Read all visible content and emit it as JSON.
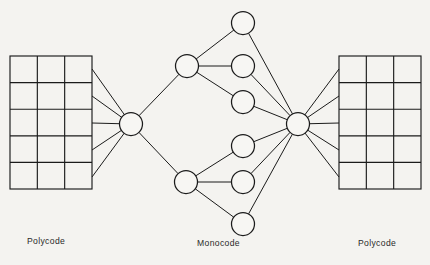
{
  "figure": {
    "background_color": "#f4f3f0",
    "stroke_color": "#1b1b1b",
    "node_fill": "#f7f6f3"
  },
  "captions": {
    "left": "Polycode",
    "middle": "Monocode",
    "right": "Polycode"
  },
  "diagram": {
    "type": "node-link-network",
    "left_grid": {
      "label": "Polycode",
      "x": 10,
      "y": 56,
      "width": 82,
      "height": 133,
      "columns": 3,
      "rows": 5
    },
    "right_grid": {
      "label": "Polycode",
      "x": 339,
      "y": 56,
      "width": 82,
      "height": 133,
      "columns": 3,
      "rows": 5
    },
    "nodes": [
      {
        "id": "hub-left",
        "name": "left-hub-node",
        "cx": 131,
        "cy": 124,
        "r": 11.5
      },
      {
        "id": "branch-up",
        "name": "upper-branch-node",
        "cx": 187,
        "cy": 66,
        "r": 11.5
      },
      {
        "id": "branch-dn",
        "name": "lower-branch-node",
        "cx": 186,
        "cy": 182,
        "r": 11.5
      },
      {
        "id": "leaf-1",
        "name": "leaf-node-1",
        "cx": 243,
        "cy": 23,
        "r": 11.5
      },
      {
        "id": "leaf-2",
        "name": "leaf-node-2",
        "cx": 243,
        "cy": 66,
        "r": 11.5
      },
      {
        "id": "leaf-3",
        "name": "leaf-node-3",
        "cx": 243,
        "cy": 102,
        "r": 11.5
      },
      {
        "id": "leaf-4",
        "name": "leaf-node-4",
        "cx": 243,
        "cy": 146,
        "r": 11.5
      },
      {
        "id": "leaf-5",
        "name": "leaf-node-5",
        "cx": 243,
        "cy": 182,
        "r": 11.5
      },
      {
        "id": "leaf-6",
        "name": "leaf-node-6",
        "cx": 243,
        "cy": 224,
        "r": 11.5
      },
      {
        "id": "hub-right",
        "name": "right-hub-node",
        "cx": 298,
        "cy": 124,
        "r": 11.5
      }
    ],
    "edges": [
      {
        "from": "left-grid-row-1",
        "to": "hub-left",
        "x1": 92,
        "y1": 69,
        "x2": 131,
        "y2": 124
      },
      {
        "from": "left-grid-row-2",
        "to": "hub-left",
        "x1": 92,
        "y1": 96,
        "x2": 131,
        "y2": 124
      },
      {
        "from": "left-grid-row-3",
        "to": "hub-left",
        "x1": 92,
        "y1": 123,
        "x2": 131,
        "y2": 124
      },
      {
        "from": "left-grid-row-4",
        "to": "hub-left",
        "x1": 92,
        "y1": 150,
        "x2": 131,
        "y2": 124
      },
      {
        "from": "left-grid-row-5",
        "to": "hub-left",
        "x1": 92,
        "y1": 177,
        "x2": 131,
        "y2": 124
      },
      {
        "from": "hub-left",
        "to": "branch-up"
      },
      {
        "from": "hub-left",
        "to": "branch-dn"
      },
      {
        "from": "branch-up",
        "to": "leaf-1"
      },
      {
        "from": "branch-up",
        "to": "leaf-2"
      },
      {
        "from": "branch-up",
        "to": "leaf-3"
      },
      {
        "from": "branch-dn",
        "to": "leaf-4"
      },
      {
        "from": "branch-dn",
        "to": "leaf-5"
      },
      {
        "from": "branch-dn",
        "to": "leaf-6"
      },
      {
        "from": "leaf-1",
        "to": "hub-right"
      },
      {
        "from": "leaf-2",
        "to": "hub-right"
      },
      {
        "from": "leaf-3",
        "to": "hub-right"
      },
      {
        "from": "leaf-4",
        "to": "hub-right"
      },
      {
        "from": "leaf-5",
        "to": "hub-right"
      },
      {
        "from": "leaf-6",
        "to": "hub-right"
      },
      {
        "from": "hub-right",
        "to": "right-grid-row-1",
        "x1": 298,
        "y1": 124,
        "x2": 339,
        "y2": 69
      },
      {
        "from": "hub-right",
        "to": "right-grid-row-2",
        "x1": 298,
        "y1": 124,
        "x2": 339,
        "y2": 96
      },
      {
        "from": "hub-right",
        "to": "right-grid-row-3",
        "x1": 298,
        "y1": 124,
        "x2": 339,
        "y2": 123
      },
      {
        "from": "hub-right",
        "to": "right-grid-row-4",
        "x1": 298,
        "y1": 124,
        "x2": 339,
        "y2": 150
      },
      {
        "from": "hub-right",
        "to": "right-grid-row-5",
        "x1": 298,
        "y1": 124,
        "x2": 339,
        "y2": 177
      }
    ]
  }
}
